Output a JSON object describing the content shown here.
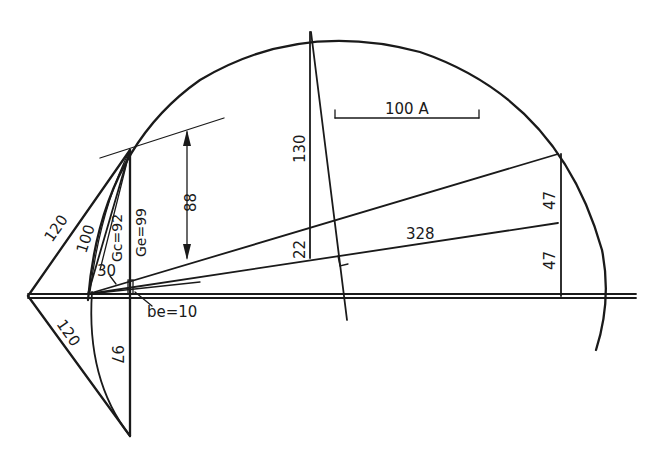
{
  "diagram": {
    "type": "circle-diagram",
    "colors": {
      "ink": "#1a1a1a",
      "background": "#ffffff"
    },
    "labels": {
      "upper_chord": "120",
      "lower_chord": "120",
      "inner_chord": "100",
      "angle_segment": "30",
      "gc": "Gc=92",
      "ge": "Ge=99",
      "dimension_arrow": "88",
      "vertical_lower": "97",
      "be": "be=10",
      "tall_vertical": "130",
      "short_vertical": "22",
      "long_line": "328",
      "right_upper": "47",
      "right_lower": "47",
      "scale_bar": "100 A"
    }
  }
}
